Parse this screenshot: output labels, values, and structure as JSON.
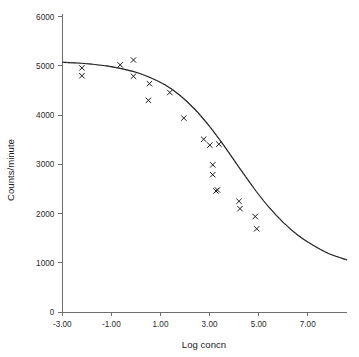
{
  "chart_data": {
    "type": "scatter",
    "title": "",
    "subtitle": "",
    "xlabel": "Log concn",
    "ylabel": "Counts/minute",
    "xlim": [
      -3.0,
      8.6
    ],
    "ylim": [
      0,
      6000
    ],
    "grid": false,
    "legend": false,
    "legend_position": "none",
    "xticks": [
      -3.0,
      -1.0,
      1.0,
      3.0,
      5.0,
      7.0
    ],
    "xtick_labels": [
      "-3.00",
      "-1.00",
      "1.00",
      "3.00",
      "5.00",
      "7.00"
    ],
    "yticks": [
      0,
      1000,
      2000,
      3000,
      4000,
      5000,
      6000
    ],
    "ytick_labels": [
      "0",
      "1000",
      "2000",
      "3000",
      "4000",
      "5000",
      "6000"
    ],
    "marker_style": "x",
    "marker_color": "#121212",
    "curve_color": "#151515",
    "series": [
      {
        "name": "observed",
        "type": "scatter",
        "points": [
          [
            -2.2,
            4960
          ],
          [
            -2.2,
            4800
          ],
          [
            -0.64,
            5020
          ],
          [
            -0.1,
            5120
          ],
          [
            -0.1,
            4790
          ],
          [
            0.55,
            4640
          ],
          [
            0.51,
            4300
          ],
          [
            1.38,
            4460
          ],
          [
            1.95,
            3940
          ],
          [
            2.76,
            3510
          ],
          [
            3.01,
            3390
          ],
          [
            3.38,
            3410
          ],
          [
            3.13,
            2990
          ],
          [
            3.13,
            2790
          ],
          [
            3.32,
            2480
          ],
          [
            3.26,
            2460
          ],
          [
            4.2,
            2250
          ],
          [
            4.24,
            2100
          ],
          [
            4.86,
            1940
          ],
          [
            4.92,
            1690
          ]
        ]
      },
      {
        "name": "fitted logistic curve",
        "type": "line",
        "model": "four-parameter logistic",
        "top": 5080,
        "bottom": 760,
        "ec50_log": 2.75,
        "hill_slope": 0.62,
        "points": [
          [
            -3.0,
            5075
          ],
          [
            -2.4,
            5060
          ],
          [
            -1.8,
            5035
          ],
          [
            -1.2,
            5000
          ],
          [
            -0.6,
            4945
          ],
          [
            0.0,
            4870
          ],
          [
            0.6,
            4760
          ],
          [
            1.2,
            4610
          ],
          [
            1.8,
            4400
          ],
          [
            2.4,
            4120
          ],
          [
            3.0,
            3770
          ],
          [
            3.6,
            3370
          ],
          [
            4.2,
            2940
          ],
          [
            4.8,
            2520
          ],
          [
            5.4,
            2140
          ],
          [
            6.0,
            1820
          ],
          [
            6.6,
            1560
          ],
          [
            7.2,
            1360
          ],
          [
            7.8,
            1200
          ],
          [
            8.4,
            1090
          ],
          [
            8.6,
            1060
          ]
        ]
      }
    ]
  },
  "axes": {
    "x_title": "Log concn",
    "y_title": "Counts/minute"
  }
}
